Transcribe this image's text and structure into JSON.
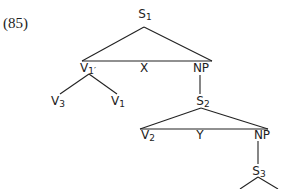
{
  "example_number": "(85)",
  "tree": {
    "nodes": [
      {
        "id": "S1",
        "label": "S",
        "sub": "1",
        "x": 145,
        "y": 8
      },
      {
        "id": "V1prime",
        "label": "V",
        "sub": "1′",
        "x": 88,
        "y": 62
      },
      {
        "id": "X",
        "label": "X",
        "sub": "",
        "x": 144,
        "y": 62
      },
      {
        "id": "NP1",
        "label": "NP",
        "sub": "",
        "x": 201,
        "y": 62
      },
      {
        "id": "V3",
        "label": "V",
        "sub": "3",
        "x": 58,
        "y": 95
      },
      {
        "id": "V1",
        "label": "V",
        "sub": "1",
        "x": 118,
        "y": 95
      },
      {
        "id": "S2",
        "label": "S",
        "sub": "2",
        "x": 203,
        "y": 95
      },
      {
        "id": "V2",
        "label": "V",
        "sub": "2",
        "x": 148,
        "y": 129
      },
      {
        "id": "Y",
        "label": "Y",
        "sub": "",
        "x": 200,
        "y": 129
      },
      {
        "id": "NP2",
        "label": "NP",
        "sub": "",
        "x": 262,
        "y": 129
      },
      {
        "id": "S3",
        "label": "S",
        "sub": "3",
        "x": 259,
        "y": 165
      }
    ],
    "edges": [
      [
        144,
        27,
        82,
        61
      ],
      [
        144,
        27,
        212,
        61
      ],
      [
        82,
        61,
        212,
        61
      ],
      [
        89,
        74,
        60,
        94
      ],
      [
        89,
        74,
        117,
        94
      ],
      [
        200,
        75,
        200,
        94
      ],
      [
        201,
        108,
        140,
        129
      ],
      [
        201,
        108,
        268,
        129
      ],
      [
        140,
        129,
        268,
        129
      ],
      [
        258,
        141,
        258,
        164
      ],
      [
        258,
        177,
        240,
        189
      ],
      [
        258,
        177,
        278,
        189
      ]
    ]
  },
  "line_color": "#222222"
}
